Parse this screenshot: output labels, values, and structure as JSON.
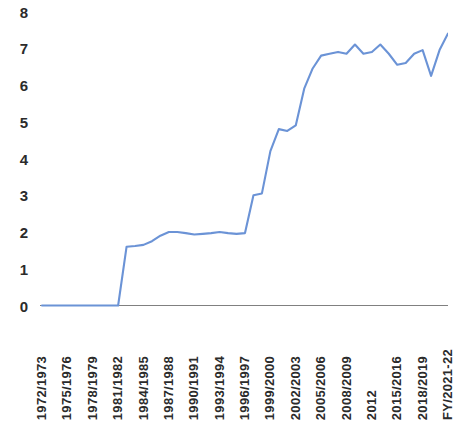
{
  "chart_data": {
    "type": "line",
    "title": "",
    "subtitle": "",
    "xlabel": "",
    "ylabel": "",
    "ylim": [
      0,
      8
    ],
    "yticks": [
      0,
      1,
      2,
      3,
      4,
      5,
      6,
      7,
      8
    ],
    "ytick_labels": [
      "0",
      "1",
      "2",
      "3",
      "4",
      "5",
      "6",
      "7",
      "8"
    ],
    "grid": false,
    "legend": false,
    "legend_position": "none",
    "line_color": "#6b93d6",
    "axis_color": "#808080",
    "x": [
      "1972/1973",
      "1973/1974",
      "1974/1975",
      "1975/1976",
      "1976/1977",
      "1977/1978",
      "1978/1979",
      "1979/1980",
      "1980/1981",
      "1981/1982",
      "1982/1983",
      "1983/1984",
      "1984/1985",
      "1985/1986",
      "1986/1987",
      "1987/1988",
      "1988/1989",
      "1989/1990",
      "1990/1991",
      "1991/1992",
      "1992/1993",
      "1993/1994",
      "1994/1995",
      "1995/1996",
      "1996/1997",
      "1997/1998",
      "1998/1999",
      "1999/2000",
      "2000/2001",
      "2001/2002",
      "2002/2003",
      "2003/2004",
      "2004/2005",
      "2005/2006",
      "2006/2007",
      "2007/2008",
      "2008/2009",
      "2009/2010",
      "2010/2011",
      "2012",
      "2013",
      "2014",
      "2015/2016",
      "2016/2017",
      "2017/2018",
      "2018/2019",
      "2019/2020",
      "2020/2021",
      "FY/2021-22"
    ],
    "values": [
      0.0,
      0.0,
      0.0,
      0.0,
      0.0,
      0.0,
      0.0,
      0.0,
      0.0,
      0.0,
      1.6,
      1.62,
      1.65,
      1.75,
      1.9,
      2.0,
      2.0,
      1.97,
      1.93,
      1.95,
      1.97,
      2.0,
      1.97,
      1.95,
      1.97,
      3.0,
      3.05,
      4.2,
      4.8,
      4.75,
      4.9,
      5.9,
      6.45,
      6.8,
      6.85,
      6.9,
      6.85,
      7.1,
      6.85,
      6.9,
      7.1,
      6.85,
      6.55,
      6.6,
      6.85,
      6.95,
      6.25,
      6.95,
      7.4
    ],
    "xtick_labels": [
      "1972/1973",
      "1975/1976",
      "1978/1979",
      "1981/1982",
      "1984/1985",
      "1987/1988",
      "1990/1991",
      "1993/1994",
      "1996/1997",
      "1999/2000",
      "2002/2003",
      "2005/2006",
      "2008/2009",
      "2012",
      "2015/2016",
      "2018/2019",
      "FY/2021-22"
    ],
    "xtick_indices": [
      0,
      3,
      6,
      9,
      12,
      15,
      18,
      21,
      24,
      27,
      30,
      33,
      36,
      39,
      42,
      45,
      48
    ]
  }
}
